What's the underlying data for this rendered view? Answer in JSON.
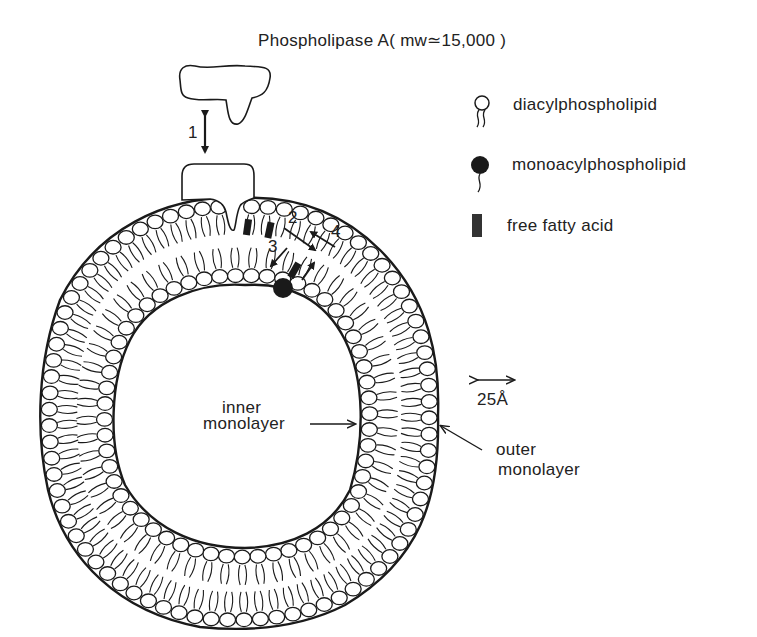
{
  "title": "Phospholipase A( mw≃15,000 )",
  "legend": {
    "items": [
      {
        "id": "diacyl",
        "label": "diacylphospholipid",
        "icon": "open-circle-two-tails"
      },
      {
        "id": "monoacyl",
        "label": "monoacylphospholipid",
        "icon": "filled-circle-one-tail"
      },
      {
        "id": "ffa",
        "label": "free fatty acid",
        "icon": "dark-rectangle"
      }
    ]
  },
  "steps": {
    "s1": "1",
    "s2": "2",
    "s3": "3",
    "s4": "4"
  },
  "labels": {
    "inner_line1": "inner",
    "inner_line2": "monolayer",
    "outer_line1": "outer",
    "outer_line2": "monolayer",
    "scale": "25Å"
  },
  "colors": {
    "ink": "#1a1a1a",
    "background": "#ffffff"
  },
  "vesicle": {
    "outer": {
      "cx": 240,
      "cy": 412,
      "rx": 198,
      "ry": 212
    },
    "inner": {
      "cx": 240,
      "cy": 412,
      "rx": 120,
      "ry": 132
    }
  }
}
